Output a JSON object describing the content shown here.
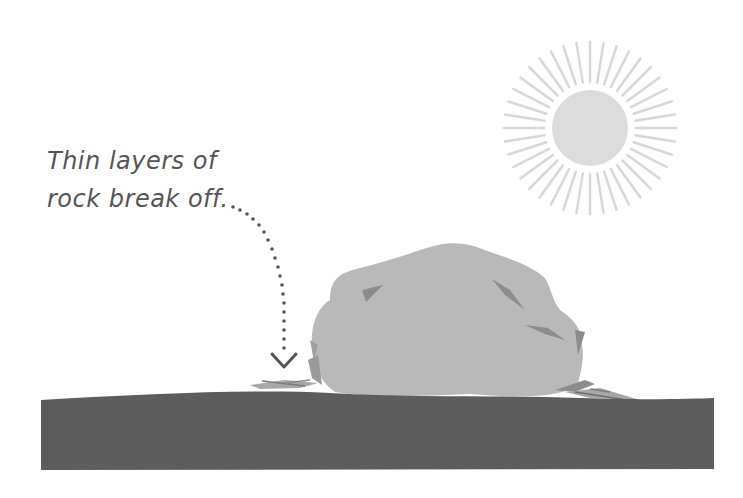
{
  "diagram": {
    "caption": {
      "line1": "Thin layers of",
      "line2": "rock break off."
    },
    "elements": {
      "sun": {
        "label": "sun",
        "color": "#dcdcdc",
        "ray_color": "#d8d8d8"
      },
      "rock": {
        "label": "boulder",
        "color": "#b9b9b9",
        "crack_color": "#8c8c8c"
      },
      "ground": {
        "label": "ground",
        "color": "#5d5d5d"
      },
      "flakes": {
        "label": "rock flakes",
        "color": "#9a9a9a"
      },
      "arrow": {
        "label": "dotted arrow pointing to flakes",
        "color": "#555555"
      }
    }
  }
}
